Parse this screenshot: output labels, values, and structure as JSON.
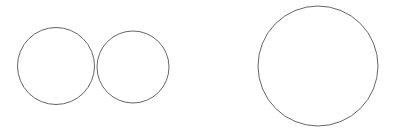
{
  "canvas": {
    "width": 395,
    "height": 129,
    "background_color": "#ffffff",
    "title": "Three outlined circles"
  },
  "style": {
    "stroke_color": "#666666",
    "stroke_width": 1,
    "fill": "none"
  },
  "shapes": [
    {
      "name": "circle-small-left",
      "type": "circle",
      "cx": 56,
      "cy": 66,
      "r": 38.5,
      "diameter": 77,
      "stroke_color": "#666666",
      "stroke_width": 1,
      "fill": "none"
    },
    {
      "name": "circle-small-middle",
      "type": "circle",
      "cx": 133,
      "cy": 67,
      "r": 36,
      "diameter": 72,
      "stroke_color": "#666666",
      "stroke_width": 1,
      "fill": "none"
    },
    {
      "name": "circle-large-right",
      "type": "circle",
      "cx": 318,
      "cy": 66,
      "r": 60,
      "diameter": 120,
      "stroke_color": "#666666",
      "stroke_width": 1,
      "fill": "none"
    }
  ]
}
